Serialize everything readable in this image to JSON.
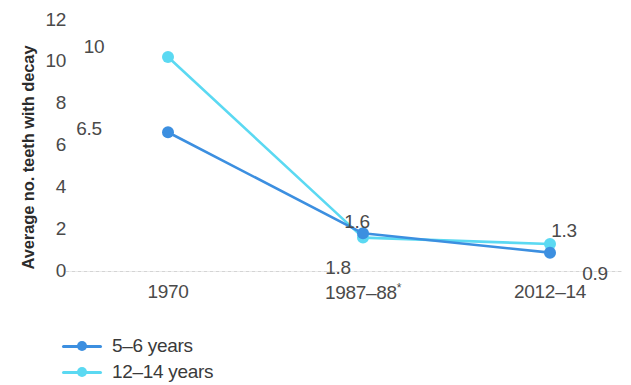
{
  "chart_data": {
    "type": "line",
    "title": "",
    "subtitle": "",
    "xlabel": "",
    "ylabel": "Average no. teeth  with decay",
    "categories": [
      "1970",
      "1987–88*",
      "2012–14"
    ],
    "ylim": [
      0,
      12
    ],
    "y_ticks": [
      0,
      2,
      4,
      6,
      8,
      10,
      12
    ],
    "grid": false,
    "legend_position": "bottom-left",
    "series": [
      {
        "name": "5–6 years",
        "color": "#3C8FE0",
        "values": [
          6.5,
          1.8,
          0.9
        ],
        "point_labels": [
          "6.5",
          "1.8",
          "0.9"
        ]
      },
      {
        "name": "12–14 years",
        "color": "#5BD9F2",
        "values": [
          10,
          1.6,
          1.3
        ],
        "point_labels": [
          "10",
          "1.6",
          "1.3"
        ]
      }
    ],
    "annotations": [
      "* asterisk on 1987–88 category label"
    ]
  },
  "axis": {
    "y_title": "Average no. teeth  with decay",
    "y_tick_labels": [
      "12",
      "10",
      "8",
      "6",
      "4",
      "2",
      "0"
    ],
    "x_tick_labels": [
      "1970",
      "1987–88",
      "2012–14"
    ],
    "x_tick_marker": "*"
  },
  "legend": {
    "items": [
      {
        "label": "5–6 years",
        "color": "#3C8FE0"
      },
      {
        "label": "12–14 years",
        "color": "#5BD9F2"
      }
    ]
  },
  "colors": {
    "series_5_6": "#3C8FE0",
    "series_12_14": "#5BD9F2",
    "text": "#4a4a4a",
    "baseline": "#cfcfcf",
    "background": "#ffffff"
  }
}
